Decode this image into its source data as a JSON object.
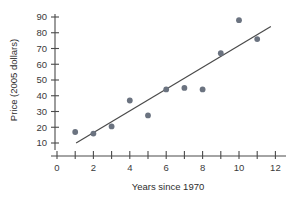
{
  "chart_data": {
    "type": "scatter",
    "title": "",
    "xlabel": "Years since 1970",
    "ylabel": "Price (2005 dollars)",
    "xlim": [
      0,
      12.6
    ],
    "ylim": [
      4,
      94
    ],
    "grid": false,
    "legend": null,
    "x_ticks_major": [
      0,
      2,
      4,
      6,
      8,
      10,
      12
    ],
    "x_ticks_minor": [
      1,
      3,
      5,
      7,
      9,
      11
    ],
    "x_tick_labels": [
      "0",
      "2",
      "4",
      "6",
      "8",
      "10",
      "12"
    ],
    "y_ticks": [
      10,
      20,
      30,
      40,
      50,
      60,
      70,
      80,
      90
    ],
    "y_tick_labels": [
      "10",
      "20",
      "30",
      "40",
      "50",
      "60",
      "70",
      "80",
      "90"
    ],
    "marker_color": "#6b7380",
    "line_color": "#4a4a4a",
    "x": [
      1,
      2,
      3,
      4,
      5,
      6,
      7,
      8,
      9,
      10,
      11
    ],
    "y": [
      17,
      16,
      20.5,
      37,
      27.5,
      44,
      45,
      44,
      67,
      88,
      76
    ],
    "points": [
      {
        "x": 1,
        "y": 17
      },
      {
        "x": 2,
        "y": 16
      },
      {
        "x": 3,
        "y": 20.5
      },
      {
        "x": 4,
        "y": 37
      },
      {
        "x": 5,
        "y": 27.5
      },
      {
        "x": 6,
        "y": 44
      },
      {
        "x": 7,
        "y": 45
      },
      {
        "x": 8,
        "y": 44
      },
      {
        "x": 9,
        "y": 67
      },
      {
        "x": 10,
        "y": 88
      },
      {
        "x": 11,
        "y": 76
      }
    ],
    "trend_line": {
      "x_start": 1.05,
      "y_start": 10,
      "x_end": 11.75,
      "y_end": 84
    }
  }
}
